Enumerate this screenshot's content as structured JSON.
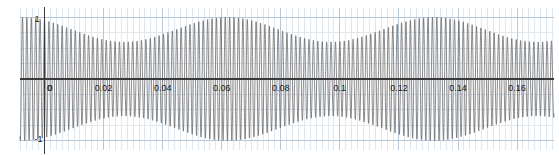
{
  "chart_data": {
    "type": "line",
    "title": "",
    "subtitle": "",
    "xlabel": "",
    "ylabel": "",
    "xlim": [
      -0.0083,
      0.1725
    ],
    "ylim": [
      -1.15,
      1.15
    ],
    "grid": true,
    "legend": null,
    "legend_position": "none",
    "x_ticks": [
      0,
      0.02,
      0.04,
      0.06,
      0.08,
      0.1,
      0.12,
      0.14,
      0.16
    ],
    "x_tick_labels": [
      "0",
      "0.02",
      "0.04",
      "0.06",
      "0.08",
      "0.1",
      "0.12",
      "0.14",
      "0.16"
    ],
    "y_ticks": [
      1,
      0,
      -1
    ],
    "y_tick_labels": [
      "1",
      "0",
      "-1"
    ],
    "x_minor_step": 0.002,
    "y_minor_step": 0.25,
    "carrier_frequency_hz": 670,
    "modulation_frequency_hz": 14.3,
    "envelope_max": 1.0,
    "envelope_min": 0.6,
    "envelope_peaks_x": [
      -0.008,
      0.0495,
      0.1195
    ],
    "envelope_troughs_x": [
      0.0215,
      0.0845,
      0.1545
    ],
    "series": [
      {
        "name": "signal",
        "color": "#555555",
        "formula": "y(t) = (0.8 + 0.2*cos(2*pi*14.3*(t+0.008))) * cos(2*pi*670*t)"
      }
    ],
    "colors": {
      "trace": "#5a5a5a",
      "axis": "#3a3a3a",
      "grid_major": "#b9c8d8",
      "grid_minor": "#dfe7ef",
      "text": "#1a1a1a",
      "background": "#ffffff"
    }
  },
  "axes": {
    "x_axis_name": "time-axis",
    "y_axis_name": "amplitude-axis"
  }
}
